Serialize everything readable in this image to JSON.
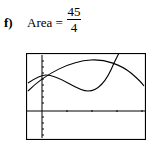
{
  "problem": {
    "label": "f)",
    "lhs": "Area =",
    "numerator": "45",
    "denominator": "4"
  },
  "graph": {
    "description": "Calculator screen showing two intersecting curves with axes"
  }
}
